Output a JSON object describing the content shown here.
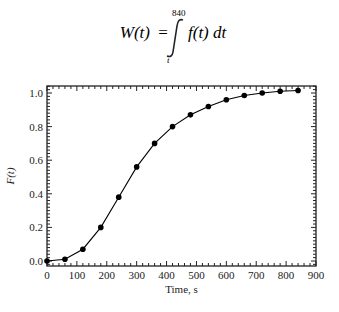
{
  "formula": {
    "lhs": "W(t)",
    "equals": "=",
    "upper_limit": "840",
    "lower_limit": "t",
    "integrand": "f(t) dt"
  },
  "chart_data": {
    "type": "line",
    "title": "",
    "xlabel": "Time, s",
    "ylabel": "F(t)",
    "xlim": [
      0,
      900
    ],
    "ylim": [
      -0.03,
      1.05
    ],
    "xticks": [
      0,
      100,
      200,
      300,
      400,
      500,
      600,
      700,
      800,
      900
    ],
    "xtick_labels": [
      "0",
      "100",
      "200",
      "300",
      "400",
      "500",
      "600",
      "700",
      "800",
      "900"
    ],
    "yticks": [
      0.0,
      0.2,
      0.4,
      0.6,
      0.8,
      1.0
    ],
    "ytick_labels": [
      "0.0",
      "0.2",
      "0.4",
      "0.6",
      "0.8",
      "1.0"
    ],
    "grid": false,
    "legend": null,
    "series": [
      {
        "name": "F(t)",
        "marker": "filled-circle",
        "color": "#000000",
        "x": [
          0,
          60,
          120,
          180,
          240,
          300,
          360,
          420,
          480,
          540,
          600,
          660,
          720,
          780,
          840
        ],
        "values": [
          0.0,
          0.01,
          0.07,
          0.2,
          0.38,
          0.56,
          0.7,
          0.8,
          0.87,
          0.92,
          0.96,
          0.985,
          1.0,
          1.01,
          1.015
        ]
      }
    ]
  }
}
